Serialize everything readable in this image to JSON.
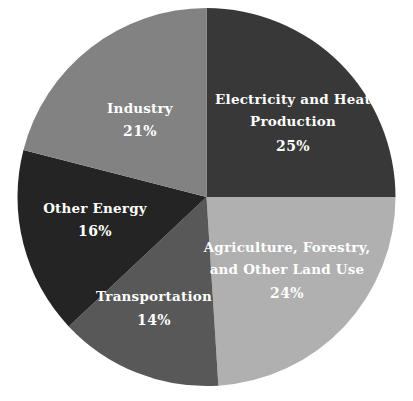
{
  "chart_data": {
    "type": "pie",
    "title": "",
    "subtitle": "",
    "xlabel": "",
    "ylabel": "",
    "legend_position": "none",
    "grid": false,
    "units": "percent",
    "start_angle_deg": 0,
    "direction": "clockwise",
    "categories": [
      "Electricity and Heat Production",
      "Agriculture, Forestry, and Other Land Use",
      "Transportation",
      "Other Energy",
      "Industry"
    ],
    "values": [
      25,
      24,
      14,
      16,
      21
    ],
    "slices": [
      {
        "label_line1": "Electricity and Heat",
        "label_line2": "Production",
        "label_full": "Electricity and Heat Production",
        "value": 25,
        "value_text": "25%",
        "color": "#383838",
        "text_color": "#ffffff"
      },
      {
        "label_line1": "Agriculture, Forestry,",
        "label_line2": "and Other Land Use",
        "label_full": "Agriculture, Forestry, and Other Land Use",
        "value": 24,
        "value_text": "24%",
        "color": "#b0b0b0",
        "text_color": "#ffffff"
      },
      {
        "label_line1": "Transportation",
        "label_line2": "",
        "label_full": "Transportation",
        "value": 14,
        "value_text": "14%",
        "color": "#585858",
        "text_color": "#ffffff"
      },
      {
        "label_line1": "Other Energy",
        "label_line2": "",
        "label_full": "Other Energy",
        "value": 16,
        "value_text": "16%",
        "color": "#242424",
        "text_color": "#ffffff"
      },
      {
        "label_line1": "Industry",
        "label_line2": "",
        "label_full": "Industry",
        "value": 21,
        "value_text": "21%",
        "color": "#828282",
        "text_color": "#ffffff"
      }
    ],
    "background_color": "#ffffff"
  }
}
